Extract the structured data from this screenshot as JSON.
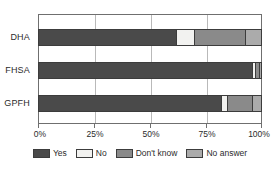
{
  "chart_data": {
    "type": "bar",
    "orientation": "horizontal",
    "stacked": true,
    "normalized": true,
    "title": "",
    "subtitle": "",
    "xlabel": "",
    "ylabel": "",
    "xlim": [
      0,
      100
    ],
    "grid": true,
    "legend_position": "bottom",
    "categories": [
      "DHA",
      "FHSA",
      "GPFH"
    ],
    "xticks": [
      0,
      25,
      50,
      75,
      100
    ],
    "xticklabels": [
      "0%",
      "25%",
      "50%",
      "75%",
      "100%"
    ],
    "series": [
      {
        "name": "Yes",
        "color": "#4a4a4a",
        "values": [
          62,
          96,
          82
        ]
      },
      {
        "name": "No",
        "color": "#f2f2f0",
        "values": [
          8,
          1.5,
          3
        ]
      },
      {
        "name": "Don't know",
        "color": "#8a8a8a",
        "values": [
          23,
          1.5,
          11
        ]
      },
      {
        "name": "No answer",
        "color": "#ababab",
        "values": [
          7,
          1,
          4
        ]
      }
    ]
  }
}
